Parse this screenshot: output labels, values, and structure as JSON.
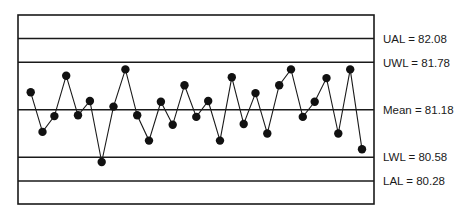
{
  "chart_data": {
    "type": "line",
    "title": "",
    "xlabel": "",
    "ylabel": "",
    "grid": false,
    "legend": "none",
    "ylim": [
      80.12,
      82.27
    ],
    "control_lines": [
      {
        "key": "UAL",
        "name": "Upper Action Limit",
        "value": 82.08,
        "label": "UAL = 82.08"
      },
      {
        "key": "UWL",
        "name": "Upper Warning Limit",
        "value": 81.78,
        "label": "UWL = 81.78"
      },
      {
        "key": "Mean",
        "name": "Mean",
        "value": 81.18,
        "label": "Mean = 81.18"
      },
      {
        "key": "LWL",
        "name": "Lower Warning Limit",
        "value": 80.58,
        "label": "LWL = 80.58"
      },
      {
        "key": "LAL",
        "name": "Lower Action Limit",
        "value": 80.28,
        "label": "LAL = 80.28"
      }
    ],
    "x": [
      1,
      2,
      3,
      4,
      5,
      6,
      7,
      8,
      9,
      10,
      11,
      12,
      13,
      14,
      15,
      16,
      17,
      18,
      19,
      20,
      21,
      22,
      23,
      24,
      25,
      26,
      27,
      28,
      29
    ],
    "series": [
      {
        "name": "Sample values",
        "values": [
          81.4,
          80.9,
          81.1,
          81.61,
          81.11,
          81.29,
          80.52,
          81.22,
          81.69,
          81.11,
          80.79,
          81.28,
          80.99,
          81.49,
          81.09,
          81.29,
          80.79,
          81.59,
          81.0,
          81.39,
          80.88,
          81.49,
          81.69,
          81.09,
          81.28,
          81.58,
          80.88,
          81.69,
          80.68
        ]
      }
    ]
  },
  "labels": {
    "ual": "UAL = 82.08",
    "uwl": "UWL = 81.78",
    "mean": "Mean = 81.18",
    "lwl": "LWL = 80.58",
    "lal": "LAL = 80.28"
  },
  "colors": {
    "ink": "#1a1a1a",
    "background": "#ffffff"
  }
}
